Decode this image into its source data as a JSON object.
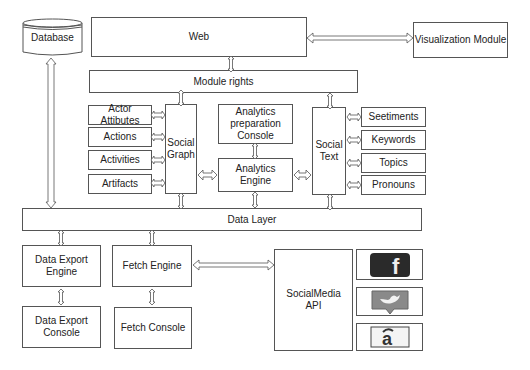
{
  "diagram": {
    "database": "Database",
    "web": "Web",
    "visualization_module": "Visualization Module",
    "module_rights": "Module rights",
    "social_graph": "Social\nGraph",
    "social_graph_items": [
      "Actor Attibutes",
      "Actions",
      "Activities",
      "Artifacts"
    ],
    "analytics_preparation_console": "Analytics\npreparation\nConsole",
    "analytics_engine": "Analytics Engine",
    "social_text": "Social\nText",
    "social_text_items": [
      "Seetiments",
      "Keywords",
      "Topics",
      "Pronouns"
    ],
    "data_layer": "Data Layer",
    "data_export_engine": "Data Export\nEngine",
    "data_export_console": "Data Export\nConsole",
    "fetch_engine": "Fetch Engine",
    "fetch_console": "Fetch Console",
    "socialmedia_api": "SocialMedia\nAPI",
    "social_icons": [
      "facebook-icon",
      "twitter-icon",
      "third-party-icon"
    ],
    "colors": {
      "facebook": "#2a2a2a",
      "twitter": "#8a8a8a",
      "line": "#555555"
    }
  }
}
